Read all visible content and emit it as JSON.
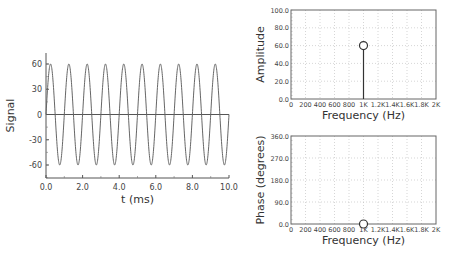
{
  "chart_data": [
    {
      "id": "time-signal",
      "type": "line",
      "title": "",
      "xlabel": "t (ms)",
      "ylabel": "Signal",
      "xlim": [
        0,
        10
      ],
      "ylim": [
        -75,
        75
      ],
      "xticks": [
        "0.0",
        "2.0",
        "4.0",
        "6.0",
        "8.0",
        "10.0"
      ],
      "yticks": [
        "60",
        "30",
        "0",
        "-30",
        "-60"
      ],
      "grid": false,
      "series": [
        {
          "name": "signal",
          "function": "60*sin(2*pi*1*t)",
          "amplitude": 60,
          "frequency_khz": 1,
          "x_range": [
            0,
            10
          ]
        },
        {
          "name": "zero-line",
          "values": [
            0,
            0
          ],
          "x": [
            0,
            10
          ]
        }
      ]
    },
    {
      "id": "amplitude-spectrum",
      "type": "scatter",
      "title": "",
      "xlabel": "Frequency (Hz)",
      "ylabel": "Amplitude",
      "xlim": [
        0,
        2000
      ],
      "ylim": [
        0,
        100
      ],
      "xticks": [
        "0",
        "200",
        "400",
        "600",
        "800",
        "1K",
        "1.2K",
        "1.4K",
        "1.6K",
        "1.8K",
        "2K"
      ],
      "yticks": [
        "100.0",
        "80.0",
        "60.0",
        "40.0",
        "20.0",
        "0.0"
      ],
      "grid": true,
      "series": [
        {
          "name": "amplitude",
          "x": [
            1000
          ],
          "values": [
            60
          ],
          "style": "stem"
        }
      ]
    },
    {
      "id": "phase-spectrum",
      "type": "scatter",
      "title": "",
      "xlabel": "Frequency (Hz)",
      "ylabel": "Phase (degrees)",
      "xlim": [
        0,
        2000
      ],
      "ylim": [
        0,
        360
      ],
      "xticks": [
        "0",
        "200",
        "400",
        "600",
        "800",
        "1K",
        "1.2K",
        "1.4K",
        "1.6K",
        "1.8K",
        "2K"
      ],
      "yticks": [
        "360.0",
        "270.0",
        "180.0",
        "90.0",
        "0.0"
      ],
      "grid": true,
      "series": [
        {
          "name": "phase",
          "x": [
            1000
          ],
          "values": [
            0
          ],
          "style": "stem"
        }
      ]
    }
  ]
}
